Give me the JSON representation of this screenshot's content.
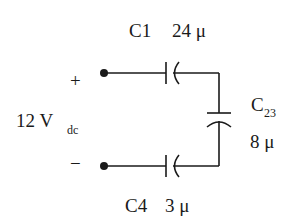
{
  "diagram": {
    "type": "circuit-schematic",
    "source": {
      "voltage_value": "12 V",
      "voltage_subscript": "dc",
      "plus_label": "+",
      "minus_label": "−"
    },
    "components": [
      {
        "id": "C1",
        "name_label": "C1",
        "value_label": "24 μ",
        "position": "top"
      },
      {
        "id": "C23",
        "name_main": "C",
        "name_subscript": "23",
        "value_label": "8 μ",
        "position": "right"
      },
      {
        "id": "C4",
        "name_label": "C4",
        "value_label": "3 μ",
        "position": "bottom"
      }
    ],
    "colors": {
      "line": "#1a1a1a",
      "background": "#ffffff"
    }
  }
}
